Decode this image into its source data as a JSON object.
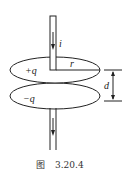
{
  "figure": {
    "caption_prefix": "图",
    "caption_number": "3.20.4",
    "labels": {
      "current": "i",
      "top_charge": "+q",
      "bottom_charge": "−q",
      "radius": "r",
      "separation": "d"
    },
    "colors": {
      "stroke": "#222222",
      "background": "#ffffff"
    }
  }
}
